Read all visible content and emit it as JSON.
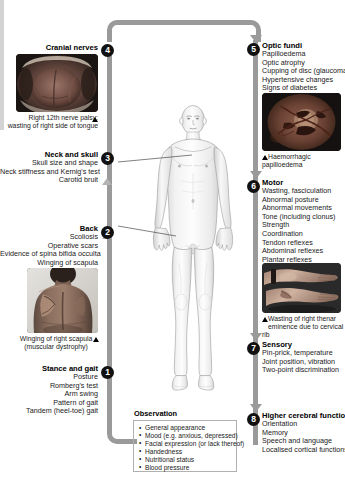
{
  "diagram": {
    "accent_badge_color": "#111111",
    "flow_color": "#9a9a9a"
  },
  "left_strip": {
    "name": "page-edge-strip"
  },
  "sections": {
    "stance_and_gait": {
      "number": "1",
      "heading": "Stance and gait",
      "items": [
        "Posture",
        "Romberg's test",
        "Arm swing",
        "Pattern of gait",
        "Tandem (heel-toe) gait"
      ]
    },
    "back": {
      "number": "2",
      "heading": "Back",
      "items": [
        "Scoliosis",
        "Operative scars",
        "Evidence of spina bifida occulta",
        "Winging of scapula"
      ],
      "photo": {
        "name": "winging-scapula-photo",
        "caption_line1": "Winging of right scapula",
        "caption_line2": "(muscular dystrophy)",
        "marker": "triangle"
      }
    },
    "neck_and_skull": {
      "number": "3",
      "heading": "Neck and skull",
      "items": [
        "Skull size and shape",
        "Neck stiffness and Kernig's test",
        "Carotid bruit"
      ]
    },
    "cranial_nerves": {
      "number": "4",
      "heading": "Cranial nerves",
      "photo": {
        "name": "tongue-wasting-photo",
        "caption_line1": "Right 12th nerve palsy:",
        "caption_line2": "wasting of right side of tongue",
        "marker": "triangle"
      }
    },
    "optic_fundi": {
      "number": "5",
      "heading": "Optic fundi",
      "items": [
        "Papilloedema",
        "Optic atrophy",
        "Cupping of disc (glaucoma)",
        "Hypertensive changes",
        "Signs of diabetes"
      ],
      "photo": {
        "name": "haemorrhagic-papilloedema-photo",
        "caption_line1": "Haemorrhagic papilloedema",
        "marker": "triangle"
      }
    },
    "motor": {
      "number": "6",
      "heading": "Motor",
      "items": [
        "Wasting, fasciculation",
        "Abnormal posture",
        "Abnormal movements",
        "Tone (including clonus)",
        "Strength",
        "Coordination",
        "Tendon reflexes",
        "Abdominal reflexes",
        "Plantar reflexes"
      ],
      "photo": {
        "name": "thenar-wasting-photo",
        "caption_line1": "Wasting of right thenar",
        "caption_line2": "eminence due to cervical rib",
        "marker": "triangle"
      }
    },
    "sensory": {
      "number": "7",
      "heading": "Sensory",
      "items": [
        "Pin-prick, temperature",
        "Joint position, vibration",
        "Two-point discrimination"
      ]
    },
    "higher_cerebral_function": {
      "number": "8",
      "heading": "Higher cerebral function",
      "items": [
        "Orientation",
        "Memory",
        "Speech and language",
        "Localised cortical functions"
      ]
    }
  },
  "observation": {
    "title": "Observation",
    "items": [
      "General appearance",
      "Mood (e.g. anxious, depressed)",
      "Facial expression (or lack thereof)",
      "Handedness",
      "Nutritional status",
      "Blood pressure"
    ]
  },
  "body_figure": {
    "name": "human-body-anterior-figure",
    "label": "Standing male body, anterior view"
  }
}
